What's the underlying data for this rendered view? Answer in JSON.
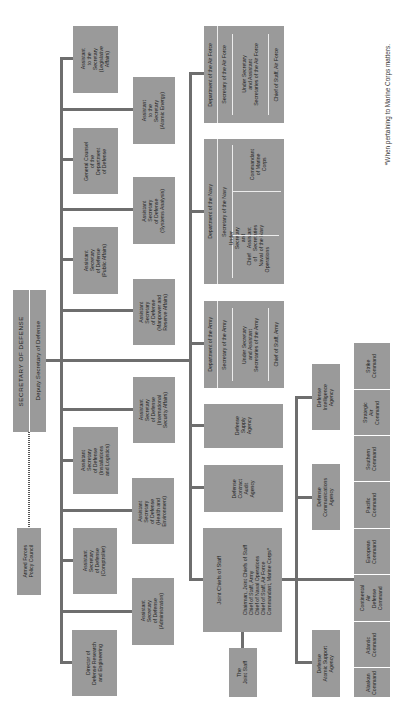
{
  "title": "SECRETARY OF DEFENSE",
  "deputy": "Deputy Secretary of Defense",
  "armed_forces_policy_council": "Armed Forces\nPolicy Council",
  "staff_offices": {
    "legislative": "Assistant\nto the\nSecretary\n(Legislative\nAffairs)",
    "atomic_energy": "Assistant\nto the\nSecretary\n(Atomic Energy)",
    "general_counsel": "General Counsel\nof the\nDepartment\nof Defense",
    "systems_analysis": "Assistant\nSecretary\nof Defense\n(Systems Analysis)",
    "public_affairs": "Assistant\nSecretary\nof Defense\n(Public Affairs)",
    "manpower": "Assistant\nSecretary\nof Defense\n(Manpower and\nReserve Affairs)",
    "isa": "Assistant\nSecretary\nof Defense\n(International\nSecurity Affairs)",
    "installations": "Assistant\nSecretary\nof Defense\n(Installations\nand Logistics)",
    "health": "Assistant\nSecretary\nof Defense\n(Health and\nEnvironment)",
    "comptroller": "Assistant\nSecretary\nof Defense\n(Comptroller)",
    "administration": "Assistant\nSecretary\nof Defense\n(Administration)",
    "ddre": "Director of\nDefense Research\nand Engineering"
  },
  "departments": {
    "air_force": {
      "title": "Department of the Air Force",
      "secretary": "Secretary of the Air Force",
      "under": "Under Secretary\nand Assistant\nSecretaries of the Air Force",
      "chief": "Chief of Staff, Air Force"
    },
    "navy": {
      "title": "Department of the Navy",
      "secretary": "Secretary of the Navy",
      "cno": "Chief\nof\nNaval\nOperations",
      "under": "Under\nSecretary\nand\nAssistant\nSecretaries\nof the Navy",
      "commandant": "Commandant\nof Marine\nCorps"
    },
    "army": {
      "title": "Department of the Army",
      "secretary": "Secretary of the Army",
      "under": "Under Secretary\nand Assistant\nSecretaries of the Army",
      "chief": "Chief of Staff, Army"
    }
  },
  "agencies": {
    "supply": "Defense\nSupply\nAgency",
    "contract_audit": "Defense\nContract\nAudit\nAgency",
    "intelligence": "Defense\nIntelligence\nAgency",
    "communications": "Defense\nCommunications\nAgency",
    "atomic_support": "Defense\nAtomic Support\nAgency"
  },
  "jcs": {
    "title": "Joint Chiefs of Staff",
    "members": "Chairman, Joint Chiefs of Staff\nChief of Staff, Army\nChief of Naval Operations\nChief of Staff, Air Force\nCommandant, Marine Corps*",
    "joint_staff": "The\nJoint Staff"
  },
  "commands": [
    "Strike\nCommand",
    "Strategic\nAir\nCommand",
    "Southern\nCommand",
    "Pacific\nCommand",
    "European\nCommand",
    "Continental\nAir\nDefense\nCommand",
    "Atlantic\nCommand",
    "Alaskan\nCommand"
  ],
  "footnote": "*When pertaining to Marine Corps matters.",
  "colors": {
    "box": "#9a9a9a",
    "line": "#6e6e6e",
    "background": "#ffffff"
  }
}
